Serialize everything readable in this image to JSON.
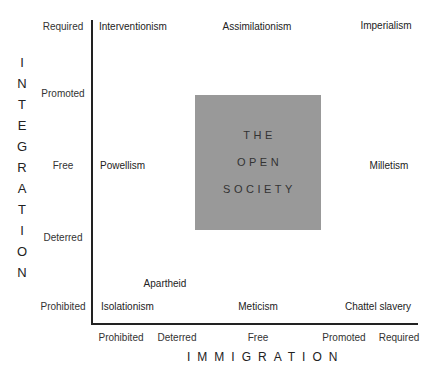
{
  "diagram": {
    "y_axis": {
      "title": "INTEGRATION",
      "title_letters": [
        "I",
        "N",
        "T",
        "E",
        "G",
        "R",
        "A",
        "T",
        "I",
        "O",
        "N"
      ],
      "ticks": [
        "Required",
        "Promoted",
        "Free",
        "Deterred",
        "Prohibited"
      ]
    },
    "x_axis": {
      "title": "IMMIGRATION",
      "ticks": [
        "Prohibited",
        "Deterred",
        "Free",
        "Promoted",
        "Required"
      ]
    },
    "labels": {
      "interventionism": "Interventionism",
      "assimilationism": "Assimilationism",
      "imperialism": "Imperialism",
      "powellism": "Powellism",
      "milletism": "Milletism",
      "apartheid": "Apartheid",
      "isolationism": "Isolationism",
      "meticism": "Meticism",
      "chattel_slavery": "Chattel slavery"
    },
    "center_box": {
      "lines": [
        "THE",
        "OPEN",
        "SOCIETY"
      ],
      "color": "#999999"
    }
  }
}
